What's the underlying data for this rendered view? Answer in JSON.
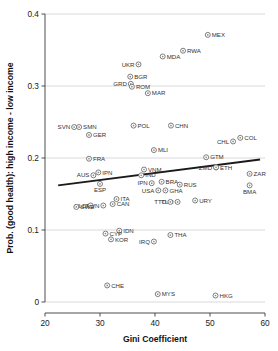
{
  "chart_data": {
    "type": "scatter",
    "title": "",
    "xlabel": "Gini Coefficient",
    "ylabel": "Prob. (good health): high income - low income",
    "xlim": [
      20,
      60
    ],
    "ylim": [
      0,
      0.4
    ],
    "xticks": [
      "20",
      "30",
      "40",
      "50",
      "60"
    ],
    "xtick_values": [
      20,
      30,
      40,
      50,
      60
    ],
    "yticks": [
      "0",
      "0.1",
      "0.2",
      "0.3",
      "0.4"
    ],
    "ytick_values": [
      0,
      0.1,
      0.2,
      0.3,
      0.4
    ],
    "grid": "horizontal",
    "legend": "none",
    "marker_style": "open-circle-with-dot",
    "points": [
      {
        "label": "MEX",
        "x": 49.6,
        "y": 0.371,
        "label_side": "right"
      },
      {
        "label": "RWA",
        "x": 45.1,
        "y": 0.349,
        "label_side": "right"
      },
      {
        "label": "MDA",
        "x": 41.4,
        "y": 0.341,
        "label_side": "right"
      },
      {
        "label": "UKR",
        "x": 37.0,
        "y": 0.33,
        "label_side": "left"
      },
      {
        "label": "BGR",
        "x": 35.5,
        "y": 0.313,
        "label_side": "right"
      },
      {
        "label": "GRD",
        "x": 35.6,
        "y": 0.303,
        "label_side": "left"
      },
      {
        "label": "ROM",
        "x": 35.8,
        "y": 0.299,
        "label_side": "right"
      },
      {
        "label": "MAR",
        "x": 38.7,
        "y": 0.29,
        "label_side": "right"
      },
      {
        "label": "SVN",
        "x": 25.3,
        "y": 0.243,
        "label_side": "left"
      },
      {
        "label": "SMN",
        "x": 26.2,
        "y": 0.243,
        "label_side": "right"
      },
      {
        "label": "POL",
        "x": 36.1,
        "y": 0.245,
        "label_side": "right"
      },
      {
        "label": "CHN",
        "x": 42.9,
        "y": 0.245,
        "label_side": "right"
      },
      {
        "label": "GER",
        "x": 28.0,
        "y": 0.232,
        "label_side": "right"
      },
      {
        "label": "CHL",
        "x": 54.2,
        "y": 0.223,
        "label_side": "left"
      },
      {
        "label": "COL",
        "x": 55.5,
        "y": 0.228,
        "label_side": "right"
      },
      {
        "label": "MLI",
        "x": 39.8,
        "y": 0.211,
        "label_side": "right"
      },
      {
        "label": "GTM",
        "x": 49.3,
        "y": 0.201,
        "label_side": "right"
      },
      {
        "label": "FRA",
        "x": 28.0,
        "y": 0.199,
        "label_side": "right"
      },
      {
        "label": "ETH",
        "x": 51.1,
        "y": 0.187,
        "label_side": "right"
      },
      {
        "label": "ZMD",
        "x": 51.1,
        "y": 0.187,
        "label_side": "left"
      },
      {
        "label": "VNM",
        "x": 38.0,
        "y": 0.184,
        "label_side": "right"
      },
      {
        "label": "IPN",
        "x": 29.7,
        "y": 0.18,
        "label_side": "right"
      },
      {
        "label": "AUS",
        "x": 28.8,
        "y": 0.176,
        "label_side": "left"
      },
      {
        "label": "IND",
        "x": 37.5,
        "y": 0.176,
        "label_side": "right"
      },
      {
        "label": "ZAR",
        "x": 57.2,
        "y": 0.178,
        "label_side": "right"
      },
      {
        "label": "BRA",
        "x": 41.2,
        "y": 0.167,
        "label_side": "right"
      },
      {
        "label": "IPN",
        "x": 39.4,
        "y": 0.165,
        "label_side": "left"
      },
      {
        "label": "ESP",
        "x": 30.0,
        "y": 0.164,
        "label_side": "below"
      },
      {
        "label": "RUS",
        "x": 44.5,
        "y": 0.163,
        "label_side": "right"
      },
      {
        "label": "BMA",
        "x": 57.2,
        "y": 0.162,
        "label_side": "below"
      },
      {
        "label": "GHA",
        "x": 41.9,
        "y": 0.155,
        "label_side": "right"
      },
      {
        "label": "USA",
        "x": 40.6,
        "y": 0.155,
        "label_side": "left"
      },
      {
        "label": "ITA",
        "x": 33.0,
        "y": 0.143,
        "label_side": "right"
      },
      {
        "label": "URY",
        "x": 47.3,
        "y": 0.141,
        "label_side": "right"
      },
      {
        "label": "TUR",
        "x": 44.1,
        "y": 0.139,
        "label_side": "left"
      },
      {
        "label": "TTO",
        "x": 42.8,
        "y": 0.139,
        "label_side": "left"
      },
      {
        "label": "CAN",
        "x": 32.3,
        "y": 0.136,
        "label_side": "right"
      },
      {
        "label": "TWN",
        "x": 30.6,
        "y": 0.134,
        "label_side": "left"
      },
      {
        "label": "NLD",
        "x": 28.3,
        "y": 0.134,
        "label_side": "left"
      },
      {
        "label": "SWE",
        "x": 25.7,
        "y": 0.132,
        "label_side": "right"
      },
      {
        "label": "IDN",
        "x": 33.5,
        "y": 0.099,
        "label_side": "right"
      },
      {
        "label": "CYP",
        "x": 31.0,
        "y": 0.095,
        "label_side": "right"
      },
      {
        "label": "THA",
        "x": 42.8,
        "y": 0.093,
        "label_side": "right"
      },
      {
        "label": "KOR",
        "x": 32.0,
        "y": 0.087,
        "label_side": "right"
      },
      {
        "label": "IRQ",
        "x": 39.8,
        "y": 0.084,
        "label_side": "left"
      },
      {
        "label": "CHE",
        "x": 31.3,
        "y": 0.023,
        "label_side": "right"
      },
      {
        "label": "MYS",
        "x": 40.5,
        "y": 0.011,
        "label_side": "right"
      },
      {
        "label": "HKG",
        "x": 51.0,
        "y": 0.009,
        "label_side": "right"
      }
    ],
    "fit_line": {
      "x_start": 22.4,
      "y_start": 0.162,
      "x_end": 59.1,
      "y_end": 0.198,
      "description": "linear fit line, slightly upward sloping"
    }
  },
  "colors": {
    "background": "#ffffff",
    "grid": "#c9c9c9",
    "axis": "#3a3a3a",
    "marker_stroke": "#6e6e6e",
    "marker_fill": "#ffffff",
    "fit_line": "#1a1a1a",
    "text": "#222222"
  }
}
